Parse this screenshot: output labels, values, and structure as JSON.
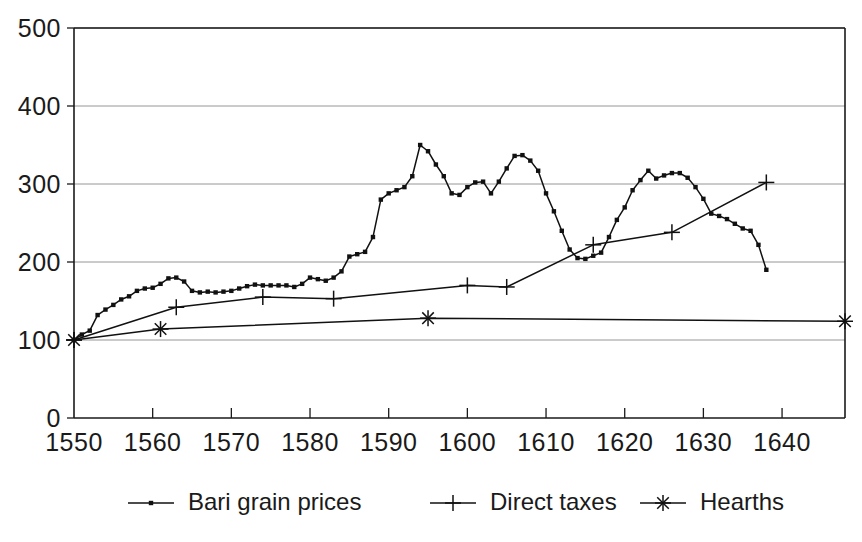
{
  "chart_data": {
    "type": "line",
    "title": "",
    "subtitle": "",
    "xlabel": "",
    "ylabel": "",
    "xlim": [
      1550,
      1648
    ],
    "ylim": [
      0,
      500
    ],
    "grid": true,
    "legend_position": "bottom",
    "x_ticks": [
      "1550",
      "1560",
      "1570",
      "1580",
      "1590",
      "1600",
      "1610",
      "1620",
      "1630",
      "1640"
    ],
    "x_tick_values": [
      1550,
      1560,
      1570,
      1580,
      1590,
      1600,
      1610,
      1620,
      1630,
      1640
    ],
    "y_ticks": [
      "0",
      "100",
      "200",
      "300",
      "400",
      "500"
    ],
    "y_tick_values": [
      0,
      100,
      200,
      300,
      400,
      500
    ],
    "series": [
      {
        "name": "Bari grain prices",
        "marker": "square-dot",
        "points": [
          [
            1550,
            100
          ],
          [
            1551,
            107
          ],
          [
            1552,
            112
          ],
          [
            1553,
            132
          ],
          [
            1554,
            139
          ],
          [
            1555,
            145
          ],
          [
            1556,
            152
          ],
          [
            1557,
            156
          ],
          [
            1558,
            163
          ],
          [
            1559,
            166
          ],
          [
            1560,
            167
          ],
          [
            1561,
            172
          ],
          [
            1562,
            179
          ],
          [
            1563,
            180
          ],
          [
            1564,
            175
          ],
          [
            1565,
            163
          ],
          [
            1566,
            161
          ],
          [
            1567,
            162
          ],
          [
            1568,
            161
          ],
          [
            1569,
            162
          ],
          [
            1570,
            163
          ],
          [
            1571,
            166
          ],
          [
            1572,
            169
          ],
          [
            1573,
            171
          ],
          [
            1574,
            170
          ],
          [
            1575,
            170
          ],
          [
            1576,
            170
          ],
          [
            1577,
            170
          ],
          [
            1578,
            168
          ],
          [
            1579,
            172
          ],
          [
            1580,
            180
          ],
          [
            1581,
            178
          ],
          [
            1582,
            176
          ],
          [
            1583,
            180
          ],
          [
            1584,
            188
          ],
          [
            1585,
            207
          ],
          [
            1586,
            210
          ],
          [
            1587,
            213
          ],
          [
            1588,
            232
          ],
          [
            1589,
            280
          ],
          [
            1590,
            288
          ],
          [
            1591,
            292
          ],
          [
            1592,
            296
          ],
          [
            1593,
            310
          ],
          [
            1594,
            350
          ],
          [
            1595,
            342
          ],
          [
            1596,
            325
          ],
          [
            1597,
            310
          ],
          [
            1598,
            288
          ],
          [
            1599,
            286
          ],
          [
            1600,
            296
          ],
          [
            1601,
            302
          ],
          [
            1602,
            303
          ],
          [
            1603,
            288
          ],
          [
            1604,
            303
          ],
          [
            1605,
            320
          ],
          [
            1606,
            336
          ],
          [
            1607,
            337
          ],
          [
            1608,
            330
          ],
          [
            1609,
            317
          ],
          [
            1610,
            288
          ],
          [
            1611,
            265
          ],
          [
            1612,
            240
          ],
          [
            1613,
            216
          ],
          [
            1614,
            205
          ],
          [
            1615,
            204
          ],
          [
            1616,
            208
          ],
          [
            1617,
            212
          ],
          [
            1618,
            232
          ],
          [
            1619,
            254
          ],
          [
            1620,
            270
          ],
          [
            1621,
            292
          ],
          [
            1622,
            305
          ],
          [
            1623,
            317
          ],
          [
            1624,
            307
          ],
          [
            1625,
            311
          ],
          [
            1626,
            314
          ],
          [
            1627,
            314
          ],
          [
            1628,
            308
          ],
          [
            1629,
            296
          ],
          [
            1630,
            281
          ],
          [
            1631,
            262
          ],
          [
            1632,
            259
          ],
          [
            1633,
            255
          ],
          [
            1634,
            249
          ],
          [
            1635,
            243
          ],
          [
            1636,
            240
          ],
          [
            1637,
            222
          ],
          [
            1638,
            190
          ]
        ]
      },
      {
        "name": "Direct taxes",
        "marker": "plus",
        "points": [
          [
            1550,
            100
          ],
          [
            1563,
            142
          ],
          [
            1574,
            155
          ],
          [
            1583,
            153
          ],
          [
            1600,
            170
          ],
          [
            1605,
            168
          ],
          [
            1616,
            222
          ],
          [
            1626,
            238
          ],
          [
            1638,
            302
          ]
        ]
      },
      {
        "name": "Hearths",
        "marker": "asterisk",
        "points": [
          [
            1550,
            100
          ],
          [
            1561,
            114
          ],
          [
            1595,
            128
          ],
          [
            1648,
            124
          ]
        ]
      }
    ]
  },
  "legend": {
    "items": [
      {
        "label": "Bari grain prices",
        "marker": "square-dot"
      },
      {
        "label": "Direct taxes",
        "marker": "plus"
      },
      {
        "label": "Hearths",
        "marker": "asterisk"
      }
    ]
  },
  "colors": {
    "ink": "#111111",
    "grid": "#8a8a8a",
    "background": "#ffffff"
  }
}
